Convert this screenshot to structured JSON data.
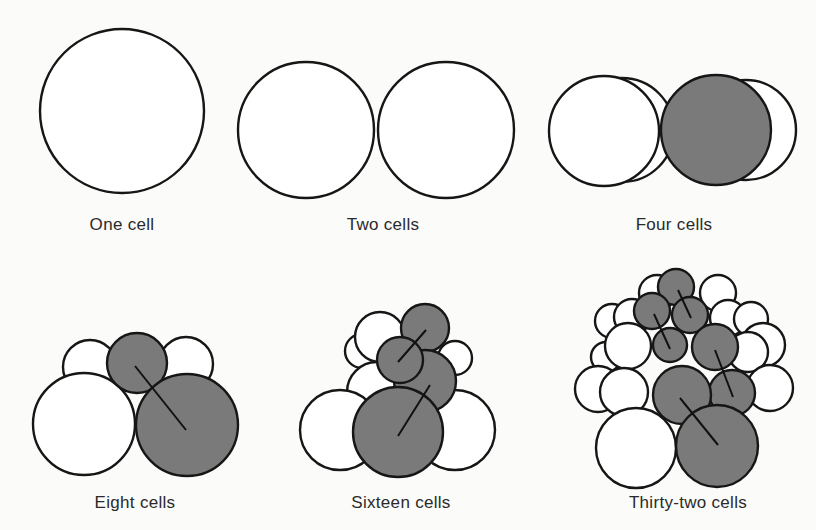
{
  "figure": {
    "panels": [
      {
        "id": "one",
        "label": "One cell"
      },
      {
        "id": "two",
        "label": "Two cells"
      },
      {
        "id": "four",
        "label": "Four cells"
      },
      {
        "id": "eight",
        "label": "Eight cells"
      },
      {
        "id": "sixteen",
        "label": "Sixteen cells"
      },
      {
        "id": "thirtytwo",
        "label": "Thirty-two cells"
      }
    ],
    "colors": {
      "cell_fill": "#ffffff",
      "shaded_fill": "#7a7a7a",
      "outline": "#161616",
      "background": "#fbfbf9"
    }
  }
}
